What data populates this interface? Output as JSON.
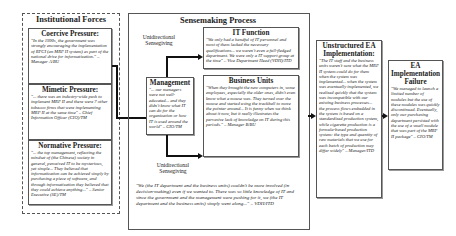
{
  "institutional_forces": {
    "title": "Institutional Forces",
    "coercive": {
      "title": "Coercive Pressure:",
      "quote": "\"In the 1990s, the government was strongly encouraging the implementation of RPCI (an MRP II system) as part of the national drive for informatization.\" – Manager A/BU"
    },
    "mimetic": {
      "title": "Mimetic Pressure:",
      "quote": "\"... there was an industry-wide push to implement MRP II and there were 7 other tobacco firms that were implementing MRP II at the same time\" – Chief Information Officer (CIO)/TM"
    },
    "normative": {
      "title": "Normative Pressure:",
      "quote": "\"... the top management, reflecting the mindset of (the Chinese) society in general, perceived IT to be mysterious, yet simple... They believed that informatization can be achieved simply by purchasing a piece of software, and through informatization they believed that they could achieve anything...\" – Senior Executive (SE)/TM"
    }
  },
  "sensemaking": {
    "title": "Sensemaking Process",
    "label_top": "Unidirectional Sensegiving",
    "label_bottom": "Unidirectional Sensegiving",
    "management": {
      "title": "Management",
      "quote": "\"... our managers were not well-educated... and they didn't know what IT can do for the organization or how IT is used around the world\" – CIO/TM"
    },
    "it_function": {
      "title": "IT Function",
      "quote": "\"We only had a handful of IT personnel and most of them lacked the necessary qualifications... we weren't even a full-fledged department. We were only a IT support group at the time\" – Vice Department Head (VDH)/ITD"
    },
    "business_units": {
      "title": "Business Units",
      "quote": "\"When they brought the new computers in, some employees, especially the older ones, didn't even know what a mouse was. They turned over the mouse and started using the trackball to move the pointer around... It is funny when we think about it now, but it really illustrates the pervasive lack of knowledge on IT during this periods.\" – Manager B/BU"
    },
    "bottom_quote": "\"We (the IT department and the business units) couldn't be more involved (in decision-making) even if we wanted to. There was so little knowledge of IT and since the government and the management were pushing for it, we (the IT department and the business units) simply went along...\" – VDH/ITD"
  },
  "unstructured": {
    "title": "Unstructured EA Implementation:",
    "quote": "\"The IT staff and the business units weren't sure what the MRP II system could do for them when the system was implemented... when the system was eventually implemented, we realized quickly that the system was incompatible with our existing business processes... the process flows embedded in the system is based on a standardized production system, while cigarette production is a formula-based production system: the type and quantity of raw materials that we use for each batch of production may differ widely\" – Manager/ITD"
  },
  "failure": {
    "title": "EA Implementation Failure",
    "quote": "\"We managed to launch a limited number of modules but the use of these modules was quickly discontinued. Eventually, only our purchasing department persisted with the use of a small module that was part of the MRP II package\" – CIO/TM"
  }
}
